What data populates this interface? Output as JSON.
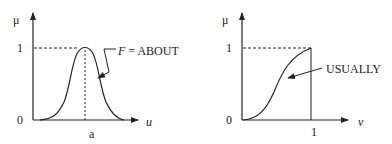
{
  "panels": [
    {
      "id": "about",
      "y_axis_label": "μ",
      "x_axis_label": "u",
      "y_ticks": [
        "0",
        "1"
      ],
      "x_tick": "a",
      "curve_label_italic": "F",
      "curve_label_rest": " = ABOUT",
      "curve_shape": "bell curve centered at a, peak μ=1"
    },
    {
      "id": "usually",
      "y_axis_label": "μ",
      "x_axis_label": "v",
      "y_ticks": [
        "0",
        "1"
      ],
      "x_tick": "1",
      "curve_label": "USUALLY",
      "curve_shape": "S-shaped increasing curve from (0,0) to (1,1)"
    }
  ],
  "colors": {
    "stroke": "#222222",
    "background": "#ffffff"
  }
}
